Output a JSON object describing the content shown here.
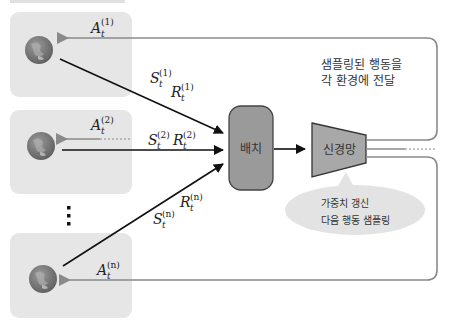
{
  "header": {
    "cut_off_caption": ""
  },
  "environments": [
    {
      "id": "1",
      "action_label": "A",
      "action_sub": "t",
      "action_sup": "(1)",
      "state_label": "S",
      "state_sub": "t",
      "state_sup": "(1)",
      "reward_label": "R",
      "reward_sub": "t",
      "reward_sup": "(1)"
    },
    {
      "id": "2",
      "action_label": "A",
      "action_sub": "t",
      "action_sup": "(2)",
      "state_label": "S",
      "state_sub": "t",
      "state_sup": "(2)",
      "reward_label": "R",
      "reward_sub": "t",
      "reward_sup": "(2)"
    },
    {
      "id": "n",
      "action_label": "A",
      "action_sub": "t",
      "action_sup": "(n)",
      "state_label": "S",
      "state_sub": "t",
      "state_sup": "(n)",
      "reward_label": "R",
      "reward_sub": "t",
      "reward_sup": "(n)"
    }
  ],
  "ellipsis": "⋮",
  "batch": {
    "label": "배치"
  },
  "network": {
    "label": "신경망"
  },
  "dispatch_note": {
    "line1": "샘플링된 행동을",
    "line2": "각 환경에 전달"
  },
  "update_callout": {
    "line1": "가중치 갱신",
    "line2": "다음 행동 샘플링"
  },
  "icons": {
    "environment": "globe-icon"
  },
  "colors": {
    "env_box": "#e6e6e6",
    "batch_fill": "#9a9a9a",
    "network_fill": "#a8a8a8",
    "callout_fill": "#e3e3e3",
    "action_arrow": "#8a8a8a",
    "state_arrow": "#111111",
    "globe": "#7a7a7a"
  }
}
